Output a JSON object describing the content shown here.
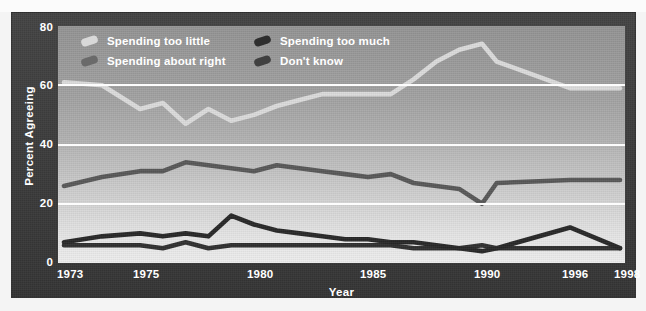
{
  "chart_data": {
    "type": "line",
    "title": "",
    "xlabel": "Year",
    "ylabel": "Percent Agreeing",
    "xlim": [
      1973,
      1998
    ],
    "ylim": [
      0,
      80
    ],
    "yticks": [
      0,
      20,
      40,
      60,
      80
    ],
    "xticks": [
      1973,
      1975,
      1980,
      1985,
      1990,
      1996,
      1998
    ],
    "grid": "horizontal gridlines at 20, 40, 60",
    "legend_position": "top-left inside plot",
    "x": [
      1973,
      1974,
      1975,
      1976,
      1977,
      1978,
      1979,
      1980,
      1981,
      1982,
      1983,
      1984,
      1985,
      1986,
      1987,
      1988,
      1989,
      1990,
      1991,
      1996,
      1998
    ],
    "series": [
      {
        "name": "Spending too little",
        "color": "#dcdcdc",
        "values": [
          61,
          60,
          52,
          54,
          47,
          52,
          48,
          50,
          53,
          55,
          57,
          57,
          57,
          57,
          62,
          68,
          72,
          74,
          68,
          59,
          59
        ]
      },
      {
        "name": "Spending about right",
        "color": "#5a5a5a",
        "values": [
          26,
          29,
          31,
          31,
          34,
          33,
          32,
          31,
          33,
          32,
          31,
          30,
          29,
          30,
          27,
          26,
          25,
          20,
          27,
          28,
          28
        ]
      },
      {
        "name": "Spending too much",
        "color": "#2d2d2d",
        "values": [
          7,
          9,
          10,
          9,
          10,
          9,
          16,
          13,
          11,
          10,
          9,
          8,
          8,
          7,
          7,
          6,
          5,
          4,
          5,
          12,
          5
        ]
      },
      {
        "name": "Don't know",
        "color": "#2d2d2d",
        "values": [
          6,
          6,
          6,
          5,
          7,
          5,
          6,
          6,
          6,
          6,
          6,
          6,
          6,
          6,
          5,
          5,
          5,
          6,
          5,
          5,
          5
        ]
      }
    ]
  },
  "legend": {
    "items": [
      {
        "label": "Spending too little",
        "swatch_color": "#d8d8d8",
        "icon": "line-swatch-icon"
      },
      {
        "label": "Spending too much",
        "swatch_color": "#2e2e2e",
        "icon": "line-swatch-icon"
      },
      {
        "label": "Spending about right",
        "swatch_color": "#616161",
        "icon": "line-swatch-icon"
      },
      {
        "label": "Don't know",
        "swatch_color": "#3a3a3a",
        "icon": "line-swatch-icon"
      }
    ]
  },
  "axes": {
    "y_title": "Percent Agreeing",
    "x_title": "Year",
    "y_ticks": [
      "0",
      "20",
      "40",
      "60",
      "80"
    ],
    "x_ticks": [
      "1973",
      "1975",
      "1980",
      "1985",
      "1990",
      "1996",
      "1998"
    ]
  },
  "colors": {
    "frame": "#3c3c3c",
    "plot_top": "#949494",
    "plot_bottom": "#eeeeee",
    "gridline": "#fdfdfd",
    "text": "#ffffff"
  }
}
